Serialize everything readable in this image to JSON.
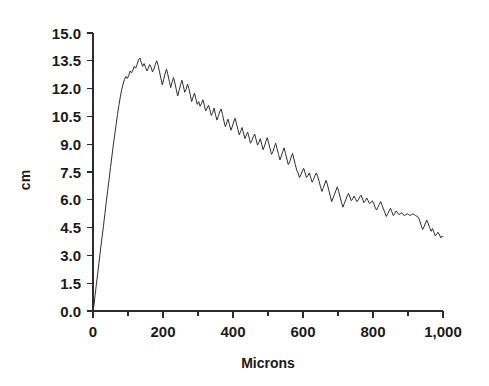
{
  "chart_data": {
    "type": "line",
    "title": "",
    "subtitle": "",
    "xlabel": "Microns",
    "ylabel": "cm",
    "xlim": [
      0,
      1000
    ],
    "ylim": [
      0,
      15
    ],
    "grid": false,
    "legend": false,
    "legend_position": "none",
    "line_color": "#2e2e2e",
    "background_color": "#ffffff",
    "axis_color": "#2b2b2b",
    "x_ticks": [
      0,
      100,
      200,
      300,
      400,
      500,
      600,
      700,
      800,
      900,
      1000
    ],
    "x_tick_labels": [
      "0",
      "",
      "200",
      "",
      "400",
      "",
      "600",
      "",
      "800",
      "",
      "1,000"
    ],
    "y_ticks": [
      0,
      1.5,
      3,
      4.5,
      6,
      7.5,
      9,
      10.5,
      12,
      13.5,
      15
    ],
    "y_tick_labels": [
      "0.0",
      "1.5",
      "3.0",
      "4.5",
      "6.0",
      "7.5",
      "9.0",
      "10.5",
      "12.0",
      "13.5",
      "15.0"
    ],
    "series": [
      {
        "name": "particle size distribution",
        "x": [
          0,
          3,
          6,
          10,
          14,
          18,
          22,
          26,
          30,
          34,
          38,
          42,
          46,
          50,
          54,
          58,
          62,
          66,
          70,
          74,
          78,
          82,
          86,
          90,
          94,
          98,
          102,
          106,
          110,
          114,
          118,
          122,
          126,
          130,
          134,
          138,
          142,
          146,
          150,
          154,
          158,
          162,
          166,
          170,
          174,
          178,
          182,
          186,
          190,
          194,
          198,
          202,
          206,
          210,
          214,
          218,
          222,
          226,
          230,
          234,
          238,
          242,
          246,
          250,
          254,
          258,
          262,
          266,
          270,
          274,
          278,
          282,
          286,
          290,
          294,
          298,
          302,
          306,
          310,
          314,
          318,
          322,
          326,
          330,
          334,
          338,
          342,
          346,
          350,
          354,
          358,
          362,
          366,
          370,
          374,
          378,
          382,
          386,
          390,
          394,
          398,
          402,
          406,
          410,
          414,
          418,
          422,
          426,
          430,
          434,
          438,
          442,
          446,
          450,
          454,
          458,
          462,
          466,
          470,
          474,
          478,
          482,
          486,
          490,
          494,
          498,
          502,
          506,
          510,
          514,
          518,
          522,
          526,
          530,
          534,
          538,
          542,
          546,
          550,
          554,
          558,
          562,
          566,
          570,
          574,
          578,
          582,
          586,
          590,
          594,
          598,
          602,
          606,
          610,
          614,
          618,
          622,
          626,
          630,
          634,
          638,
          642,
          646,
          650,
          654,
          658,
          662,
          666,
          670,
          674,
          678,
          682,
          686,
          690,
          694,
          698,
          702,
          706,
          710,
          714,
          718,
          722,
          726,
          730,
          734,
          738,
          742,
          746,
          750,
          754,
          758,
          762,
          766,
          770,
          774,
          778,
          782,
          786,
          790,
          794,
          798,
          802,
          806,
          810,
          814,
          818,
          822,
          826,
          830,
          834,
          838,
          842,
          846,
          850,
          854,
          858,
          862,
          866,
          870,
          874,
          878,
          882,
          886,
          890,
          894,
          898,
          902,
          906,
          910,
          914,
          918,
          922,
          926,
          930,
          934,
          938,
          942,
          946,
          950,
          954,
          958,
          962,
          966,
          970,
          974,
          978,
          982,
          986,
          990,
          994,
          998,
          1000
        ],
        "y": [
          0.0,
          0.35,
          0.85,
          1.5,
          2.1,
          2.75,
          3.4,
          4.0,
          4.6,
          5.25,
          5.9,
          6.5,
          7.1,
          7.75,
          8.35,
          8.95,
          9.5,
          10.05,
          10.6,
          11.1,
          11.55,
          11.95,
          12.25,
          12.5,
          12.65,
          12.55,
          12.7,
          12.95,
          12.85,
          13.0,
          13.2,
          13.1,
          13.3,
          13.55,
          13.65,
          13.4,
          13.2,
          13.35,
          13.15,
          12.95,
          13.1,
          13.3,
          13.15,
          12.9,
          13.05,
          13.3,
          13.5,
          13.25,
          12.9,
          12.55,
          12.2,
          12.5,
          12.8,
          13.05,
          12.75,
          12.4,
          12.05,
          12.35,
          12.6,
          12.3,
          11.95,
          11.6,
          11.9,
          12.2,
          12.45,
          12.15,
          11.8,
          11.95,
          12.25,
          12.0,
          11.65,
          11.3,
          11.55,
          11.75,
          11.45,
          11.15,
          11.3,
          11.05,
          11.2,
          11.4,
          11.1,
          10.8,
          10.95,
          11.1,
          10.85,
          10.55,
          10.7,
          10.95,
          10.6,
          10.3,
          10.5,
          10.75,
          10.9,
          10.6,
          10.25,
          9.95,
          10.15,
          10.35,
          10.05,
          9.75,
          9.95,
          10.2,
          10.4,
          10.1,
          9.8,
          9.5,
          9.7,
          9.9,
          9.6,
          9.3,
          9.5,
          9.65,
          9.35,
          9.05,
          9.2,
          9.4,
          9.55,
          9.25,
          8.95,
          9.1,
          9.3,
          9.0,
          8.7,
          8.9,
          9.15,
          9.35,
          9.05,
          8.75,
          8.45,
          8.6,
          8.85,
          9.05,
          8.75,
          8.45,
          8.15,
          8.35,
          8.6,
          8.8,
          8.5,
          8.2,
          7.9,
          8.05,
          8.3,
          8.5,
          8.2,
          7.9,
          7.6,
          7.45,
          7.2,
          7.35,
          7.55,
          7.7,
          7.45,
          7.2,
          7.3,
          7.45,
          7.2,
          6.95,
          7.1,
          7.3,
          7.45,
          7.25,
          7.0,
          6.7,
          6.45,
          6.65,
          6.85,
          7.05,
          6.8,
          6.5,
          6.2,
          5.9,
          6.1,
          6.3,
          6.5,
          6.7,
          6.45,
          6.15,
          5.85,
          5.6,
          5.8,
          6.0,
          6.2,
          6.35,
          6.15,
          5.95,
          6.05,
          6.2,
          6.05,
          5.9,
          6.0,
          6.15,
          6.25,
          6.05,
          5.85,
          5.95,
          6.1,
          5.95,
          5.8,
          5.85,
          5.95,
          5.8,
          5.6,
          5.45,
          5.6,
          5.75,
          5.9,
          5.7,
          5.5,
          5.3,
          5.1,
          5.25,
          5.4,
          5.55,
          5.35,
          5.15,
          5.25,
          5.4,
          5.3,
          5.2,
          5.25,
          5.3,
          5.2,
          5.15,
          5.2,
          5.25,
          5.2,
          5.15,
          5.2,
          5.25,
          5.2,
          5.15,
          5.1,
          5.05,
          4.85,
          4.6,
          4.4,
          4.55,
          4.75,
          4.9,
          4.7,
          4.5,
          4.3,
          4.45,
          4.25,
          4.05,
          4.15,
          4.25,
          4.1,
          3.95,
          4.05,
          4.0
        ]
      }
    ]
  },
  "axis": {
    "y_label": "cm",
    "x_label": "Microns"
  }
}
